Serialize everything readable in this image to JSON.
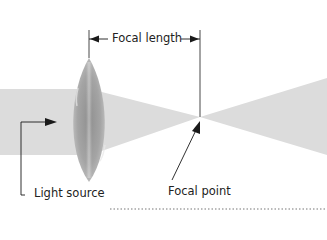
{
  "diagram": {
    "labels": {
      "focal_length": "Focal length",
      "light_source": "Light source",
      "focal_point": "Focal point"
    },
    "elements": {
      "light_beam": "incoming parallel light beam",
      "lens": "convex lens",
      "converging_cone": "converging light rays",
      "diverging_cone": "diverging light rays"
    },
    "colors": {
      "beam": "#d9d9d9",
      "lens": "#a8a8a8",
      "lines": "#1a1a1a",
      "text": "#222222"
    }
  }
}
